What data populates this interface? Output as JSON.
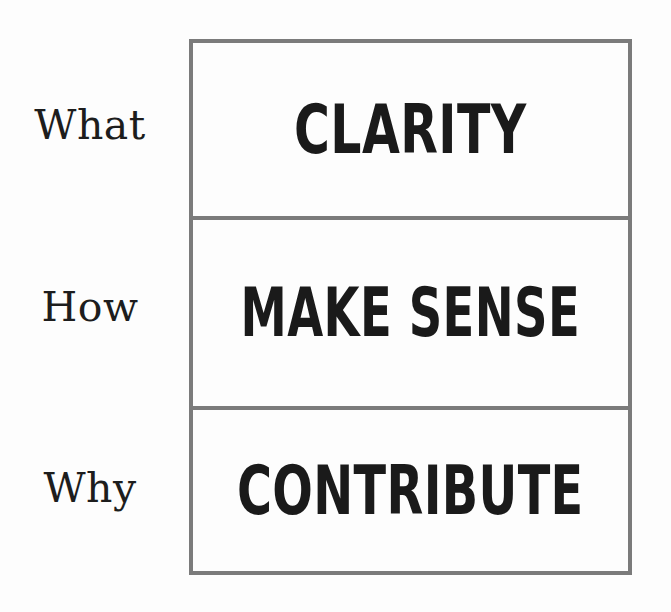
{
  "diagram": {
    "frame": {
      "border_color": "#7b7b7b",
      "background_color": "#fdfdfd",
      "text_color": "#1a1a1a",
      "label_color": "#1d1d1d"
    },
    "rows": [
      {
        "label": "What",
        "value": "CLARITY"
      },
      {
        "label": "How",
        "value": "MAKE SENSE"
      },
      {
        "label": "Why",
        "value": "CONTRIBUTE"
      }
    ]
  }
}
